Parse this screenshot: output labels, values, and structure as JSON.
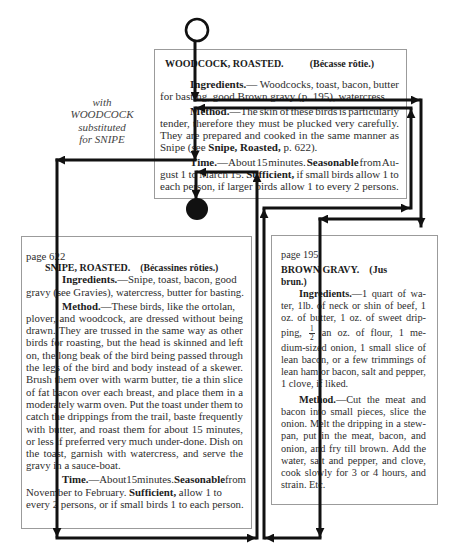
{
  "annotation": {
    "lines": [
      "with",
      "WOODCOCK",
      "substituted",
      "for SNIPE"
    ]
  },
  "recipes": {
    "woodcock": {
      "title": "WOODCOCK, ROASTED.",
      "french_title": "(Bécasse rôtie.)",
      "lines": [
        {
          "indent": true,
          "justify": true,
          "segs": [
            {
              "t": "Ingredients.",
              "b": true
            },
            {
              "t": "— Woodcocks, toast, bacon, butter"
            }
          ]
        },
        {
          "segs": [
            {
              "t": "for basting, good Brown gravy (p. 195), watercress."
            }
          ]
        },
        {
          "indent": true,
          "para": true,
          "justify": true,
          "segs": [
            {
              "t": "Method.",
              "b": true
            },
            {
              "t": "—The skin of these birds is particularly"
            }
          ]
        },
        {
          "justify": true,
          "segs": [
            {
              "t": "tender, therefore they must be plucked very carefully."
            }
          ]
        },
        {
          "justify": true,
          "segs": [
            {
              "t": "They are prepared and cooked in the same manner as"
            }
          ]
        },
        {
          "segs": [
            {
              "t": "Snipe (see "
            },
            {
              "t": "Snipe, Roasted,",
              "b": true
            },
            {
              "t": " p. 622)."
            }
          ]
        },
        {
          "indent": true,
          "para": true,
          "justify": true,
          "segs": [
            {
              "t": "Time.",
              "b": true
            },
            {
              "t": "—About 15 minutes. "
            },
            {
              "t": "Seasonable",
              "b": true
            },
            {
              "t": " from Au-"
            }
          ]
        },
        {
          "justify": true,
          "segs": [
            {
              "t": "gust 1 to March 15. "
            },
            {
              "t": "Sufficient,",
              "b": true
            },
            {
              "t": " if small birds allow 1 to"
            }
          ]
        },
        {
          "segs": [
            {
              "t": "each person, if larger birds allow 1 to every 2 persons."
            }
          ]
        }
      ]
    },
    "snipe": {
      "page": "page 622",
      "title": "SNIPE, ROASTED.",
      "french_title": "(Bécassines rôties.)",
      "lines": [
        {
          "indent": true,
          "segs": [
            {
              "t": "Ingredients.",
              "b": true
            },
            {
              "t": "—Snipe, toast, bacon, good"
            }
          ]
        },
        {
          "segs": [
            {
              "t": "gravy (see Gravies), watercress, butter for basting."
            }
          ]
        },
        {
          "indent": true,
          "para": true,
          "segs": [
            {
              "t": "Method.",
              "b": true
            },
            {
              "t": "—These birds, like the ortolan,"
            }
          ]
        },
        {
          "justify": true,
          "segs": [
            {
              "t": "plover, and woodcock, are dressed without being"
            }
          ]
        },
        {
          "justify": true,
          "segs": [
            {
              "t": "drawn. They are trussed in the same way as other"
            }
          ]
        },
        {
          "justify": true,
          "segs": [
            {
              "t": "birds for roasting, but the head is skinned and left"
            }
          ]
        },
        {
          "justify": true,
          "segs": [
            {
              "t": "on, the long beak of the bird being passed through"
            }
          ]
        },
        {
          "justify": true,
          "segs": [
            {
              "t": "the legs of the bird and body instead of a skewer."
            }
          ]
        },
        {
          "justify": true,
          "segs": [
            {
              "t": "Brush them over with warm butter, tie a thin slice"
            }
          ]
        },
        {
          "justify": true,
          "segs": [
            {
              "t": "of fat bacon over each breast, and place them in a"
            }
          ]
        },
        {
          "justify": true,
          "segs": [
            {
              "t": "moderately warm oven. Put the toast under them to"
            }
          ]
        },
        {
          "justify": true,
          "segs": [
            {
              "t": "catch the drippings from the trail, baste frequently"
            }
          ]
        },
        {
          "justify": true,
          "segs": [
            {
              "t": "with butter, and roast them for about 15 minutes,"
            }
          ]
        },
        {
          "justify": true,
          "segs": [
            {
              "t": "or less if preferred very much under-done. Dish on"
            }
          ]
        },
        {
          "justify": true,
          "segs": [
            {
              "t": "the toast, garnish with watercress, and serve the"
            }
          ]
        },
        {
          "segs": [
            {
              "t": "gravy in a sauce-boat."
            }
          ]
        },
        {
          "indent": true,
          "para": true,
          "justify": true,
          "segs": [
            {
              "t": "Time.",
              "b": true
            },
            {
              "t": "—About 15 minutes. "
            },
            {
              "t": "Seasonable",
              "b": true
            },
            {
              "t": " from"
            }
          ]
        },
        {
          "segs": [
            {
              "t": "November to February. "
            },
            {
              "t": "Sufficient,",
              "b": true
            },
            {
              "t": " allow 1 to"
            }
          ]
        },
        {
          "segs": [
            {
              "t": "every 2 persons, or if small birds 1 to each person."
            }
          ]
        }
      ]
    },
    "brown_gravy": {
      "page": "page 195",
      "title": "BROWN GRAVY.",
      "french_title": "(Jus",
      "french_title_cont": "brun.)",
      "lines": [
        {
          "indent": true,
          "justify": true,
          "segs": [
            {
              "t": "Ingredients.",
              "b": true
            },
            {
              "t": "—1 quart of wa-"
            }
          ]
        },
        {
          "justify": true,
          "segs": [
            {
              "t": "ter, 1lb. of neck or shin of beef, 1"
            }
          ]
        },
        {
          "justify": true,
          "segs": [
            {
              "t": "oz. of butter, 1 oz. of sweet drip-"
            }
          ]
        },
        {
          "justify": true,
          "frac": true,
          "segs": [
            {
              "t": "ping, "
            },
            {
              "t": "1/2",
              "frac": true
            },
            {
              "t": " an oz. of flour, 1 me-"
            }
          ]
        },
        {
          "justify": true,
          "segs": [
            {
              "t": "dium-sized onion, 1 small slice of"
            }
          ]
        },
        {
          "justify": true,
          "segs": [
            {
              "t": "lean bacon, or a few trimmings of"
            }
          ]
        },
        {
          "justify": true,
          "segs": [
            {
              "t": "lean ham or bacon, salt and pepper,"
            }
          ]
        },
        {
          "segs": [
            {
              "t": "1 clove, if liked."
            }
          ]
        },
        {
          "indent": true,
          "para": true,
          "justify": true,
          "segs": [
            {
              "t": "Method.",
              "b": true
            },
            {
              "t": "—Cut the meat and"
            }
          ]
        },
        {
          "justify": true,
          "segs": [
            {
              "t": "bacon into small pieces, slice the"
            }
          ]
        },
        {
          "justify": true,
          "segs": [
            {
              "t": "onion. Melt the dripping in a stew-"
            }
          ]
        },
        {
          "justify": true,
          "segs": [
            {
              "t": "pan, put in the meat, bacon, and"
            }
          ]
        },
        {
          "justify": true,
          "segs": [
            {
              "t": "onion, and fry till brown. Add the"
            }
          ]
        },
        {
          "justify": true,
          "segs": [
            {
              "t": "water, salt and pepper, and clove,"
            }
          ]
        },
        {
          "justify": true,
          "segs": [
            {
              "t": "cook slowly for 3 or 4 hours, and"
            }
          ]
        },
        {
          "segs": [
            {
              "t": "strain. Etc."
            }
          ]
        }
      ]
    }
  },
  "flow": {
    "start_marker": "open-circle",
    "end_marker": "filled-circle",
    "arrow_color": "#111111"
  }
}
